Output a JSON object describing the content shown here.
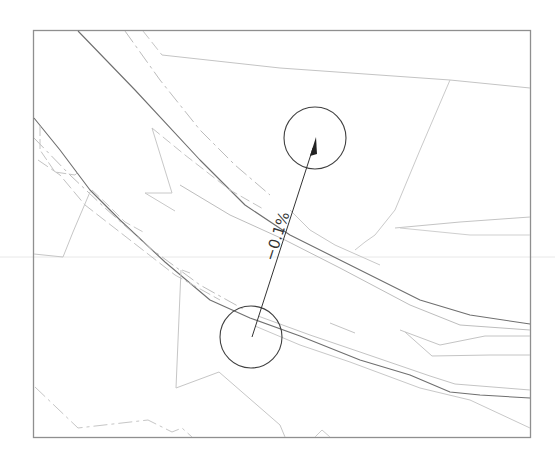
{
  "drawing": {
    "frame": {
      "x": 33,
      "y": 30,
      "width": 497,
      "height": 407
    },
    "colors": {
      "frame": "#8a8a8a",
      "main_line": "#6a6a6a",
      "light_line": "#c4c4c4",
      "dash_line": "#bdbdbd",
      "annotation": "#3a3a3a",
      "guide": "#e6e6e6"
    },
    "slope_annotation": {
      "label": "−0.1%",
      "start_circle": {
        "cx": 251,
        "cy": 337,
        "r": 31
      },
      "end_circle": {
        "cx": 315,
        "cy": 138,
        "r": 31
      },
      "arrow": {
        "from": [
          252,
          337
        ],
        "to": [
          316,
          137
        ]
      }
    }
  }
}
